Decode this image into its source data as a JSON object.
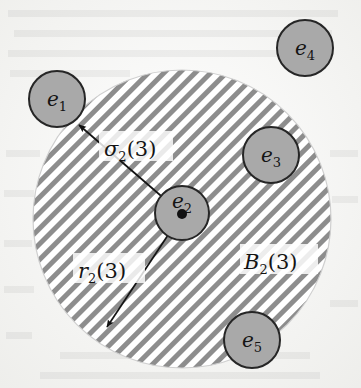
{
  "figure": {
    "background_color": "#fbfbfa",
    "page_texture": "scanned-paper",
    "ball": {
      "name": "B_2(3)",
      "label_main": "B",
      "label_sub": "2",
      "label_arg": "(3)",
      "center_x": 182,
      "center_y": 219,
      "radius": 149,
      "fill": "hatched",
      "hatch_color": "#8a8a8a",
      "hatch_angle_deg": 45,
      "hatch_spacing_px": 11,
      "outline_color": "#c9c9c9",
      "label_position": {
        "x": 245,
        "y": 268
      }
    },
    "nodes": [
      {
        "id": "e1",
        "label_main": "e",
        "label_sub": "1",
        "cx": 57,
        "cy": 99,
        "r": 28,
        "fill": "#a8a8a8",
        "stroke": "#2b2b2b",
        "inside_ball": false
      },
      {
        "id": "e2",
        "label_main": "e",
        "label_sub": "2",
        "cx": 182,
        "cy": 213,
        "r": 27,
        "fill": "#a8a8a8",
        "stroke": "#2b2b2b",
        "inside_ball": true,
        "has_center_dot": true,
        "center_dot_r": 5,
        "center_dot_color": "#111111",
        "is_ball_center": true
      },
      {
        "id": "e3",
        "label_main": "e",
        "label_sub": "3",
        "cx": 271,
        "cy": 155,
        "r": 28,
        "fill": "#a8a8a8",
        "stroke": "#2b2b2b",
        "inside_ball": true
      },
      {
        "id": "e4",
        "label_main": "e",
        "label_sub": "4",
        "cx": 305,
        "cy": 48,
        "r": 28,
        "fill": "#a8a8a8",
        "stroke": "#2b2b2b",
        "inside_ball": false
      },
      {
        "id": "e5",
        "label_main": "e",
        "label_sub": "5",
        "cx": 252,
        "cy": 340,
        "r": 28,
        "fill": "#a8a8a8",
        "stroke": "#2b2b2b",
        "inside_ball": false
      }
    ],
    "arrows": [
      {
        "id": "sigma",
        "label_main": "σ",
        "label_sub": "2",
        "label_arg": "(3)",
        "from_x": 182,
        "from_y": 214,
        "to_x": 76,
        "to_y": 123,
        "color": "#1a1a1a",
        "label_position": {
          "x": 112,
          "y": 152
        },
        "description": "arrow from ball center e2 to node e1"
      },
      {
        "id": "radius",
        "label_main": "r",
        "label_sub": "2",
        "label_arg": "(3)",
        "from_x": 182,
        "from_y": 214,
        "to_x": 104,
        "to_y": 332,
        "color": "#1a1a1a",
        "label_position": {
          "x": 83,
          "y": 276
        },
        "description": "radius arrow from ball center e2 to ball boundary"
      }
    ]
  }
}
